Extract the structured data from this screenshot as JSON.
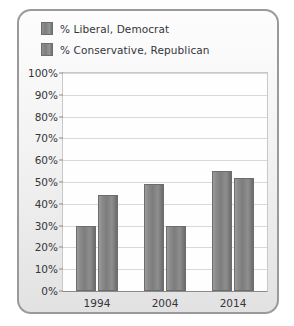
{
  "chart_data": {
    "type": "bar",
    "title": "",
    "xlabel": "",
    "ylabel": "",
    "categories": [
      "1994",
      "2004",
      "2014"
    ],
    "series": [
      {
        "name": "% Liberal, Democrat",
        "values": [
          30,
          49,
          55
        ]
      },
      {
        "name": "% Conservative, Republican",
        "values": [
          44,
          30,
          52
        ]
      }
    ],
    "ylim": [
      0,
      100
    ],
    "ytick_labels": [
      "100%",
      "90%",
      "80%",
      "70%",
      "60%",
      "50%",
      "40%",
      "30%",
      "20%",
      "10%",
      "0%"
    ],
    "ytick_values": [
      100,
      90,
      80,
      70,
      60,
      50,
      40,
      30,
      20,
      10,
      0
    ],
    "grid": true,
    "legend_position": "top-left",
    "bar_color": "#838383",
    "grid_color": "#d8d8d8",
    "axis_color": "#8a8a8a",
    "text_color": "#35353a"
  }
}
